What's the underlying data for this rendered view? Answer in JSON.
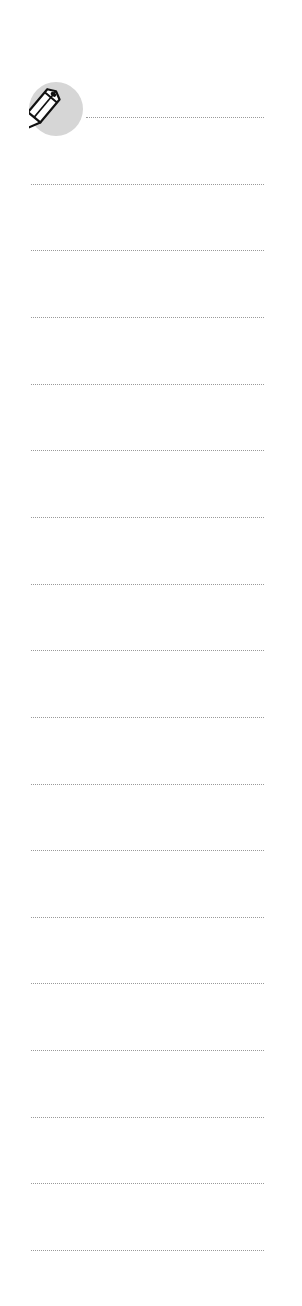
{
  "page": {
    "type": "note-lines",
    "background": "#ffffff",
    "line_color": "#9a9a9a",
    "icon": {
      "name": "pencil-icon",
      "badge_color": "#d6d6d6"
    },
    "lines": {
      "count": 18,
      "first_y": 117,
      "spacing": 66.65,
      "first_line_x_start": 86,
      "x_start": 31,
      "x_end": 264
    }
  }
}
